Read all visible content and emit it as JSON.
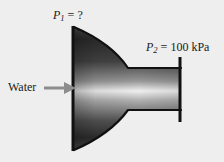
{
  "figure": {
    "background_color": "#eeeeee",
    "labels": {
      "inlet_pressure": {
        "symbol": "P",
        "subscript": "1",
        "relation": "=",
        "value": "?",
        "full_text": "P1 = ?"
      },
      "outlet_pressure": {
        "symbol": "P",
        "subscript": "2",
        "relation": "=",
        "value": "100 kPa",
        "full_text": "P2 = 100 kPa"
      },
      "fluid": "Water"
    },
    "colors": {
      "outline": "#111111",
      "flange": "#111111",
      "arrow": "#8c8c8c",
      "text": "#1a1a1a",
      "gradient_dark": "#2b2b2b",
      "gradient_mid": "#f2f2f2",
      "gradient_edge": "#3a3a3a"
    },
    "icons": {
      "flow_arrow": "right-arrow-icon"
    }
  }
}
